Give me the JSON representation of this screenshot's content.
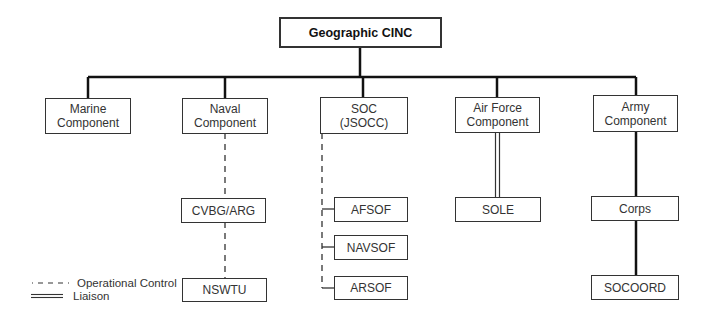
{
  "root": {
    "label": "Geographic CINC"
  },
  "components": [
    {
      "id": "marine",
      "line1": "Marine",
      "line2": "Component"
    },
    {
      "id": "naval",
      "line1": "Naval",
      "line2": "Component"
    },
    {
      "id": "soc",
      "line1": "SOC",
      "line2": "(JSOCC)"
    },
    {
      "id": "airforce",
      "line1": "Air Force",
      "line2": "Component"
    },
    {
      "id": "army",
      "line1": "Army",
      "line2": "Component"
    }
  ],
  "naval_children": [
    {
      "label": "CVBG/ARG"
    },
    {
      "label": "NSWTU"
    }
  ],
  "soc_children": [
    {
      "label": "AFSOF"
    },
    {
      "label": "NAVSOF"
    },
    {
      "label": "ARSOF"
    }
  ],
  "airforce_children": [
    {
      "label": "SOLE"
    }
  ],
  "army_children": [
    {
      "label": "Corps"
    },
    {
      "label": "SOCOORD"
    }
  ],
  "legend": {
    "operational_control": "Operational Control",
    "liaison": "Liaison"
  },
  "relationships": {
    "naval_to_cvbg": "operational-control",
    "cvbg_to_nswtu": "operational-control",
    "soc_to_sof": "operational-control",
    "airforce_to_sole": "liaison",
    "army_to_corps": "command",
    "corps_to_socoord": "command"
  }
}
